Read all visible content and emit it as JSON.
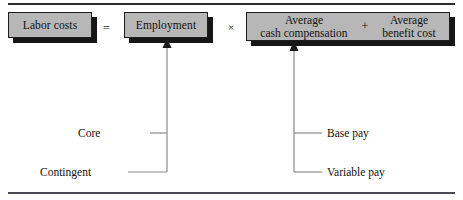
{
  "figure": {
    "type": "equation-diagram",
    "title_text": "",
    "colors": {
      "box_fill": "#b7b7b7",
      "box_border": "#1d1d1d",
      "box_shadow": "#161616",
      "rule": "#2b2b2b",
      "text": "#111111",
      "connector": "#7a7a7a"
    }
  },
  "equation": {
    "terms": [
      {
        "id": "labor-costs",
        "label": "Labor costs"
      },
      {
        "id": "employment",
        "label": "Employment"
      },
      {
        "id": "average-compensation",
        "label_left": "Average\ncash compensation",
        "label_right": "Average\nbenefit cost"
      }
    ],
    "operators": {
      "equals": "=",
      "times": "×",
      "plus": "+"
    }
  },
  "boxes": {
    "labor_costs": {
      "line1": "Labor costs"
    },
    "employment": {
      "line1": "Employment"
    },
    "average_cash_compensation": {
      "line1": "Average",
      "line2": "cash compensation"
    },
    "average_benefit_cost": {
      "line1": "Average",
      "line2": "benefit cost"
    }
  },
  "callouts": {
    "employment": [
      {
        "label": "Core"
      },
      {
        "label": "Contingent"
      }
    ],
    "average_cash_compensation": [
      {
        "label": "Base pay"
      },
      {
        "label": "Variable pay"
      }
    ]
  }
}
